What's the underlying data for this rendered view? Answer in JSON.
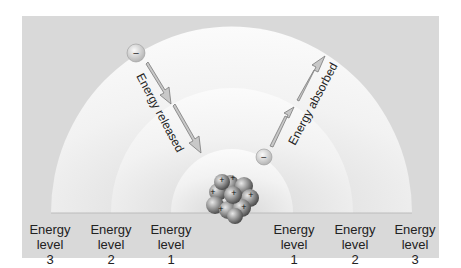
{
  "diagram": {
    "title": "",
    "rotated_labels": {
      "released": "Energy released",
      "absorbed": "Energy absorbed"
    },
    "electron_symbol": "−",
    "proton_symbol": "+",
    "left_labels": [
      {
        "line1": "Energy",
        "line2": "level",
        "line3": "3"
      },
      {
        "line1": "Energy",
        "line2": "level",
        "line3": "2"
      },
      {
        "line1": "Energy",
        "line2": "level",
        "line3": "1"
      }
    ],
    "right_labels": [
      {
        "line1": "Energy",
        "line2": "level",
        "line3": "1"
      },
      {
        "line1": "Energy",
        "line2": "level",
        "line3": "2"
      },
      {
        "line1": "Energy",
        "line2": "level",
        "line3": "3"
      }
    ],
    "colors": {
      "background_panel": "#d9d9d9",
      "shell_fill": "#f4f4f4",
      "arrow": "#9a9a9a",
      "nucleus": "#8a8a8a"
    }
  }
}
